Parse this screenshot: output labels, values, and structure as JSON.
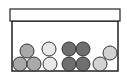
{
  "diagram": {
    "type": "box-with-balls",
    "colors": {
      "outline": "#222222",
      "lid_fill": "#ffffff",
      "box_fill": "#ffffff",
      "ball_stroke": "#333333"
    },
    "lid": {
      "x": 10,
      "y": 9,
      "width": 110,
      "height": 12
    },
    "box": {
      "x": 12,
      "y": 21,
      "width": 106,
      "height": 50
    },
    "balls": [
      {
        "group": "medium-gray",
        "cx": 20,
        "cy": 64,
        "r": 7,
        "fill": "#a9a9a9"
      },
      {
        "group": "medium-gray",
        "cx": 34,
        "cy": 64,
        "r": 7,
        "fill": "#a9a9a9"
      },
      {
        "group": "medium-gray",
        "cx": 27,
        "cy": 51,
        "r": 7,
        "fill": "#a9a9a9"
      },
      {
        "group": "light",
        "cx": 50,
        "cy": 64,
        "r": 7,
        "fill": "#e8e8e8"
      },
      {
        "group": "light",
        "cx": 49,
        "cy": 49,
        "r": 7,
        "fill": "#e8e8e8"
      },
      {
        "group": "dark-gray",
        "cx": 69,
        "cy": 64,
        "r": 7,
        "fill": "#6f6f6f"
      },
      {
        "group": "dark-gray",
        "cx": 83,
        "cy": 64,
        "r": 7,
        "fill": "#6f6f6f"
      },
      {
        "group": "dark-gray",
        "cx": 69,
        "cy": 49,
        "r": 7,
        "fill": "#6f6f6f"
      },
      {
        "group": "dark-gray",
        "cx": 83,
        "cy": 49,
        "r": 7,
        "fill": "#6f6f6f"
      },
      {
        "group": "light-gray",
        "cx": 100,
        "cy": 64,
        "r": 7,
        "fill": "#d2d2d2"
      },
      {
        "group": "light-gray",
        "cx": 110,
        "cy": 53,
        "r": 7,
        "fill": "#d2d2d2"
      }
    ]
  }
}
